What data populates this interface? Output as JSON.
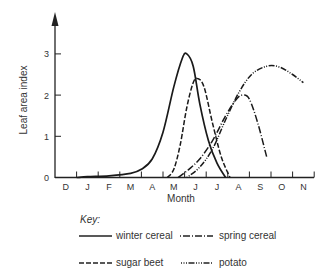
{
  "chart_data": {
    "type": "line",
    "title": "",
    "xlabel": "Month",
    "ylabel": "Leaf area index",
    "x": [
      "D",
      "J",
      "F",
      "M",
      "A",
      "M",
      "J",
      "J",
      "A",
      "S",
      "O",
      "N"
    ],
    "yticks": [
      0,
      1,
      2,
      3
    ],
    "ylim": [
      0,
      3.7
    ],
    "grid": false,
    "legend_title": "Key:",
    "legend_position": "bottom",
    "series": [
      {
        "name": "winter cereal",
        "style": "solid",
        "points": [
          [
            0.5,
            0
          ],
          [
            1.0,
            0.02
          ],
          [
            2.0,
            0.04
          ],
          [
            3.0,
            0.1
          ],
          [
            3.5,
            0.2
          ],
          [
            4.0,
            0.45
          ],
          [
            4.5,
            1.1
          ],
          [
            5.0,
            2.2
          ],
          [
            5.4,
            2.9
          ],
          [
            5.6,
            3.0
          ],
          [
            5.9,
            2.7
          ],
          [
            6.2,
            1.8
          ],
          [
            6.6,
            0.9
          ],
          [
            7.0,
            0.35
          ],
          [
            7.4,
            0.0
          ]
        ]
      },
      {
        "name": "sugar beet",
        "style": "dashed",
        "points": [
          [
            4.7,
            0
          ],
          [
            5.0,
            0.2
          ],
          [
            5.3,
            0.8
          ],
          [
            5.6,
            1.7
          ],
          [
            5.9,
            2.3
          ],
          [
            6.1,
            2.4
          ],
          [
            6.4,
            2.2
          ],
          [
            6.8,
            1.3
          ],
          [
            7.2,
            0.5
          ],
          [
            7.6,
            0.0
          ]
        ]
      },
      {
        "name": "spring cereal",
        "style": "dash-dot",
        "points": [
          [
            5.2,
            0
          ],
          [
            5.7,
            0.2
          ],
          [
            6.2,
            0.45
          ],
          [
            6.8,
            0.9
          ],
          [
            7.4,
            1.5
          ],
          [
            7.9,
            1.9
          ],
          [
            8.2,
            2.0
          ],
          [
            8.5,
            1.9
          ],
          [
            8.9,
            1.3
          ],
          [
            9.3,
            0.5
          ]
        ]
      },
      {
        "name": "potato",
        "style": "dot-dash",
        "points": [
          [
            5.6,
            0
          ],
          [
            6.2,
            0.25
          ],
          [
            6.8,
            0.7
          ],
          [
            7.4,
            1.4
          ],
          [
            8.0,
            2.05
          ],
          [
            8.6,
            2.5
          ],
          [
            9.3,
            2.7
          ],
          [
            9.9,
            2.68
          ],
          [
            10.5,
            2.5
          ],
          [
            11.0,
            2.3
          ]
        ]
      }
    ]
  },
  "axes": {
    "y_label": "Leaf area index",
    "x_label": "Month",
    "y_ticks": [
      "0",
      "1",
      "2",
      "3"
    ],
    "x_ticks": [
      "D",
      "J",
      "F",
      "M",
      "A",
      "M",
      "J",
      "J",
      "A",
      "S",
      "O",
      "N"
    ]
  },
  "legend": {
    "title": "Key:",
    "items": [
      {
        "label": "winter cereal",
        "style": "solid"
      },
      {
        "label": "spring cereal",
        "style": "dash-dot"
      },
      {
        "label": "sugar beet",
        "style": "dashed"
      },
      {
        "label": "potato",
        "style": "dot-dash"
      }
    ]
  }
}
